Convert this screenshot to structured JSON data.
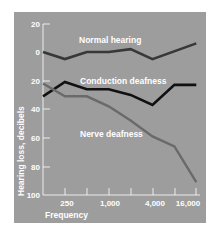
{
  "chart_data": {
    "type": "line",
    "title": "",
    "xlabel": "Frequency",
    "ylabel": "Hearing loss, decibels",
    "x": [
      125,
      250,
      500,
      1000,
      2000,
      4000,
      8000,
      16000
    ],
    "x_tick_labels": [
      "250",
      "1,000",
      "4,000",
      "16,000"
    ],
    "x_tick_label_values": [
      250,
      1000,
      4000,
      16000
    ],
    "x_tick_marks": [
      250,
      500,
      1000,
      2000,
      4000,
      8000,
      16000
    ],
    "y_tick_labels": [
      "20",
      "0",
      "20",
      "40",
      "60",
      "80",
      "100"
    ],
    "y_tick_values": [
      -20,
      0,
      20,
      40,
      60,
      80,
      100
    ],
    "ylim": [
      -20,
      100
    ],
    "y_inverted": true,
    "x_scale": "log2",
    "grid": false,
    "legend": "inline labels",
    "series": [
      {
        "name": "Normal hearing",
        "color": "#383838",
        "x": [
          125,
          250,
          500,
          1000,
          2000,
          4000,
          16000
        ],
        "values": [
          0,
          5,
          0,
          0,
          -2,
          5,
          -6
        ]
      },
      {
        "name": "Conduction deafness",
        "color": "#111111",
        "x": [
          125,
          250,
          500,
          1000,
          2000,
          4000,
          8000,
          16000
        ],
        "values": [
          31,
          21,
          26,
          26,
          30,
          37,
          23,
          23
        ]
      },
      {
        "name": "Nerve deafness",
        "color": "#6a6a6a",
        "x": [
          125,
          250,
          500,
          1000,
          2000,
          4000,
          8000,
          16000
        ],
        "values": [
          22,
          31,
          31,
          38,
          48,
          59,
          66,
          91
        ]
      }
    ]
  },
  "labels": {
    "normal": "Normal hearing",
    "conduction": "Conduction deafness",
    "nerve": "Nerve deafness",
    "xlabel": "Frequency",
    "ylabel": "Hearing loss, decibels",
    "yticks": [
      "20",
      "0",
      "20",
      "40",
      "60",
      "80",
      "100"
    ],
    "xticks": [
      "250",
      "1,000",
      "4,000",
      "16,000"
    ]
  }
}
